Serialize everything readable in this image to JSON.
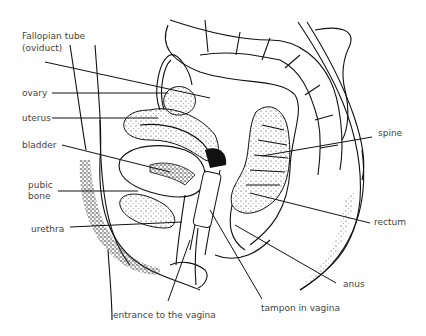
{
  "diagram": {
    "labels": {
      "fallopian_tube": "Fallopian tube",
      "fallopian_tube_alt": "(oviduct)",
      "ovary": "ovary",
      "uterus": "uterus",
      "bladder": "bladder",
      "pubic_bone_1": "pubic",
      "pubic_bone_2": "bone",
      "urethra": "urethra",
      "entrance": "entrance to the vagina",
      "tampon": "tampon in vagina",
      "spine": "spine",
      "rectum": "rectum",
      "anus": "anus"
    }
  }
}
